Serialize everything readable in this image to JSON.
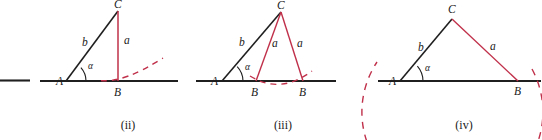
{
  "figure": {
    "colors": {
      "black": "#1f1f1f",
      "red": "#c0304a",
      "background": "#ffffff"
    },
    "stray_segment": {
      "label": ""
    },
    "panels": [
      {
        "id": "ii",
        "caption": "(ii)",
        "caption_x": 128,
        "caption_y": 129,
        "baseline": {
          "x1": 40,
          "y1": 81,
          "x2": 178,
          "y2": 81
        },
        "points": {
          "A": {
            "x": 66,
            "y": 81,
            "label": "A",
            "lx": 56,
            "ly": 85
          },
          "B": {
            "x": 118,
            "y": 81,
            "label": "B",
            "lx": 114,
            "ly": 96
          },
          "C": {
            "x": 118,
            "y": 11,
            "label": "C",
            "lx": 114,
            "ly": 8
          }
        },
        "sides": {
          "b": {
            "label": "b",
            "lx": 82,
            "ly": 46
          },
          "a": {
            "label": "a",
            "lx": 124,
            "ly": 44
          }
        },
        "angle": {
          "label": "α",
          "lx": 88,
          "ly": 69
        },
        "arc": {
          "description": "dashed red arc tangent to baseline at B, rising to the right"
        }
      },
      {
        "id": "iii",
        "caption": "(iii)",
        "caption_x": 283,
        "caption_y": 129,
        "baseline": {
          "x1": 196,
          "y1": 81,
          "x2": 336,
          "y2": 81
        },
        "points": {
          "A": {
            "x": 222,
            "y": 81,
            "label": "A",
            "lx": 211,
            "ly": 85
          },
          "B1": {
            "x": 256,
            "y": 81,
            "label": "B",
            "lx": 251,
            "ly": 96
          },
          "B2": {
            "x": 303,
            "y": 81,
            "label": "B",
            "lx": 299,
            "ly": 96
          },
          "C": {
            "x": 281,
            "y": 12,
            "label": "C",
            "lx": 277,
            "ly": 9
          }
        },
        "sides": {
          "b": {
            "label": "b",
            "lx": 239,
            "ly": 46
          },
          "a1": {
            "label": "a",
            "lx": 272,
            "ly": 47
          },
          "a2": {
            "label": "a",
            "lx": 297,
            "ly": 47
          }
        },
        "angle": {
          "label": "α",
          "lx": 245,
          "ly": 70
        },
        "arc": {
          "description": "dashed red arc dipping below baseline between the two B points"
        }
      },
      {
        "id": "iv",
        "caption": "(iv)",
        "caption_x": 464,
        "caption_y": 129,
        "baseline": {
          "x1": 378,
          "y1": 81,
          "x2": 540,
          "y2": 81
        },
        "points": {
          "A": {
            "x": 400,
            "y": 81,
            "label": "A",
            "lx": 389,
            "ly": 85
          },
          "B": {
            "x": 518,
            "y": 81,
            "label": "B",
            "lx": 514,
            "ly": 95
          },
          "C": {
            "x": 452,
            "y": 19,
            "label": "C",
            "lx": 448,
            "ly": 13
          }
        },
        "sides": {
          "b": {
            "label": "b",
            "lx": 418,
            "ly": 51
          },
          "a": {
            "label": "a",
            "lx": 490,
            "ly": 50
          }
        },
        "angle": {
          "label": "α",
          "lx": 425,
          "ly": 71
        },
        "arc": {
          "description": "large dashed red circle centered at C passing through B and below A"
        }
      }
    ]
  }
}
